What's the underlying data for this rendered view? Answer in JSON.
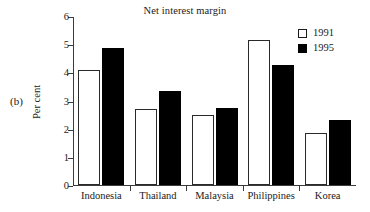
{
  "panel": {
    "letter": "(b)"
  },
  "chart_data": {
    "type": "bar",
    "title": "Net interest margin",
    "xlabel": "",
    "ylabel": "Per cent",
    "ylim": [
      0,
      6
    ],
    "yticks": [
      0,
      1,
      2,
      3,
      4,
      5,
      6
    ],
    "ytick_labels": [
      "0",
      "1",
      "2",
      "3",
      "4",
      "5",
      "6"
    ],
    "grid": false,
    "legend_position": "top-right",
    "categories": [
      "Indonesia",
      "Thailand",
      "Malaysia",
      "Philippines",
      "Korea"
    ],
    "series": [
      {
        "name": "1991",
        "color": "#ffffff",
        "edge_color": "#2a2a2a",
        "values": [
          4.1,
          2.7,
          2.5,
          5.15,
          1.85
        ]
      },
      {
        "name": "1995",
        "color": "#000000",
        "edge_color": "#000000",
        "values": [
          4.85,
          3.35,
          2.75,
          4.25,
          2.3
        ]
      }
    ]
  },
  "colors": {
    "axis": "#3b3b3b",
    "text": "#1a1a1a",
    "background": "#ffffff"
  }
}
